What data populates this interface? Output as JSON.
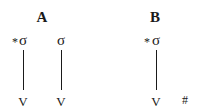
{
  "panels": {
    "a": {
      "label": "A",
      "columns": [
        {
          "star": "*",
          "syllable": "σ",
          "segment": "V"
        },
        {
          "star": "",
          "syllable": "σ",
          "segment": "V"
        }
      ]
    },
    "b": {
      "label": "B",
      "columns": [
        {
          "star": "*",
          "syllable": "σ",
          "segment": "V",
          "boundary": "#"
        }
      ]
    }
  },
  "colors": {
    "ink": "#1a1a1a",
    "background": "#ffffff"
  }
}
